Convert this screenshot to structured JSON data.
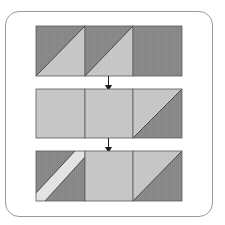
{
  "diagram": {
    "colors": {
      "dark": "#8c8c8c",
      "light": "#c9c9c9",
      "band": "#e6e6e6",
      "outline": "#5a5a5a",
      "arrow": "#1a1a1a",
      "frame": "#9a9a9a"
    },
    "rows": [
      {
        "name": "row-1",
        "squares": [
          {
            "type": "half-square-triangle",
            "upper_left": "dark",
            "lower_right": "light"
          },
          {
            "type": "half-square-triangle",
            "upper_left": "dark",
            "lower_right": "light"
          },
          {
            "type": "solid",
            "fill": "dark"
          }
        ]
      },
      {
        "name": "row-2",
        "squares": [
          {
            "type": "solid",
            "fill": "light"
          },
          {
            "type": "solid",
            "fill": "light"
          },
          {
            "type": "half-square-triangle",
            "upper_left": "light",
            "lower_right": "dark"
          }
        ]
      },
      {
        "name": "row-3",
        "squares": [
          {
            "type": "diagonal-band",
            "fill": "dark",
            "band": "band"
          },
          {
            "type": "solid",
            "fill": "light"
          },
          {
            "type": "half-square-triangle",
            "upper_left": "light",
            "lower_right": "dark"
          }
        ]
      }
    ],
    "arrows": [
      {
        "from": "row-1",
        "to": "row-2",
        "direction": "down"
      },
      {
        "from": "row-2",
        "to": "row-3",
        "direction": "down"
      }
    ]
  }
}
